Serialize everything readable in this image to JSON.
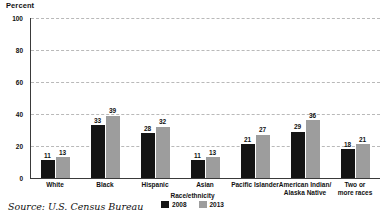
{
  "chart_data": {
    "type": "bar",
    "title": "",
    "ylabel": "Percent",
    "xlabel": "Race/ethnicity",
    "ylim": [
      0,
      100
    ],
    "yticks": [
      0,
      20,
      40,
      60,
      80,
      100
    ],
    "grid": true,
    "legend_position": "bottom",
    "legend_title": "Race/ethnicity",
    "categories": [
      "White",
      "Black",
      "Hispanic",
      "Asian",
      "Pacific Islander",
      "American Indian/\nAlaska Native",
      "Two or\nmore races"
    ],
    "series": [
      {
        "name": "2008",
        "color": "#141414",
        "values": [
          11,
          33,
          28,
          11,
          21,
          29,
          18
        ]
      },
      {
        "name": "2013",
        "color": "#9d9d9d",
        "values": [
          13,
          39,
          32,
          13,
          27,
          36,
          21
        ]
      }
    ],
    "source": "Source: U.S. Census Bureau"
  }
}
